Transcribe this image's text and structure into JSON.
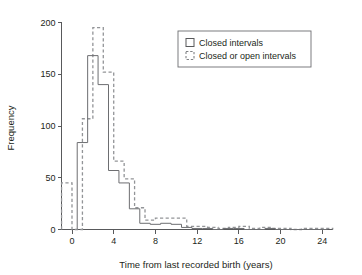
{
  "chart_data": {
    "type": "line",
    "style": "step-histogram-outline",
    "title": "",
    "xlabel": "Time from last recorded birth (years)",
    "ylabel": "Frequency",
    "xlim": [
      -1.2,
      25.0
    ],
    "ylim": [
      0,
      205
    ],
    "xticks": [
      0,
      4,
      8,
      12,
      16,
      20,
      24
    ],
    "xtick_labels": [
      "0",
      "4",
      "8",
      "12",
      "16",
      "20",
      "24"
    ],
    "yticks": [
      0,
      50,
      100,
      150,
      200
    ],
    "ytick_labels": [
      "0",
      "50",
      "100",
      "150",
      "200"
    ],
    "grid": false,
    "legend_position": "top-right",
    "bin_width": 1,
    "series": [
      {
        "name": "Closed intervals",
        "line_style": "solid",
        "color": "#6d6e71",
        "bin_edges": [
          0.5,
          1.5,
          2.5,
          3.5,
          4.5,
          5.5,
          6.5,
          7.5,
          8.5,
          9.5,
          10.5,
          11.5,
          12.5,
          13.5,
          14.5,
          15.5,
          16.5,
          17.5,
          18.5,
          19.5,
          20.5,
          21.5,
          22.5,
          23.5,
          24.5
        ],
        "values": [
          84,
          168,
          140,
          57,
          45,
          20,
          6,
          5,
          6,
          5,
          2,
          1,
          1,
          0,
          1,
          1,
          0,
          0,
          1,
          0,
          0,
          0,
          0,
          0
        ]
      },
      {
        "name": "Closed or open intervals",
        "line_style": "dashed",
        "color": "#929497",
        "bin_edges": [
          -1.0,
          0.0,
          1.0,
          2.0,
          3.0,
          4.0,
          5.0,
          6.0,
          7.0,
          8.0,
          9.0,
          10.0,
          11.0,
          12.0,
          13.0,
          14.0,
          15.0,
          16.0,
          17.0,
          18.0,
          19.0,
          20.0,
          21.0,
          22.0,
          23.0,
          24.0,
          25.0
        ],
        "values": [
          45,
          0,
          107,
          195,
          152,
          66,
          49,
          21,
          9,
          11,
          11,
          11,
          3,
          3,
          2,
          1,
          2,
          3,
          1,
          2,
          1,
          1,
          0,
          1,
          1,
          1
        ]
      }
    ]
  },
  "legend": {
    "entries": [
      {
        "label": "Closed intervals",
        "marker": "solid-square-outline"
      },
      {
        "label": "Closed or open intervals",
        "marker": "dashed-square-outline"
      }
    ]
  },
  "axes": {
    "x_title": "Time from last recorded birth (years)",
    "y_title": "Frequency"
  }
}
